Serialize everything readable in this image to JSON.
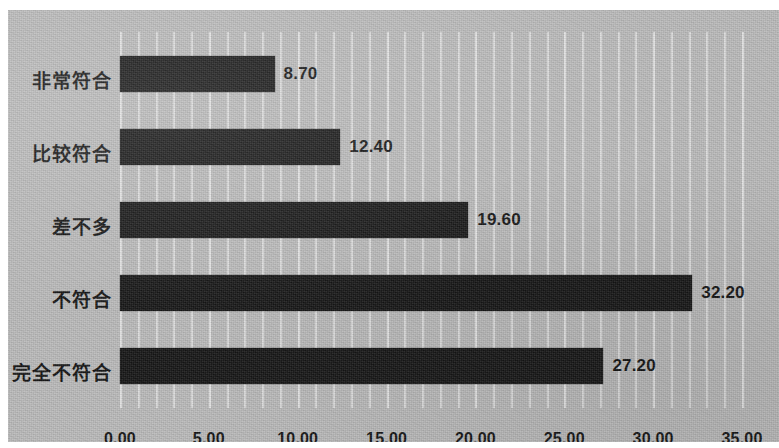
{
  "chart_data": {
    "type": "bar",
    "orientation": "horizontal",
    "title": "",
    "subtitle": "",
    "xlabel": "",
    "ylabel": "",
    "categories": [
      "非常符合",
      "比较符合",
      "差不多",
      "不符合",
      "完全不符合"
    ],
    "values": [
      8.7,
      12.4,
      19.6,
      32.2,
      27.2
    ],
    "value_labels": [
      "8.70",
      "12.40",
      "19.60",
      "32.20",
      "27.20"
    ],
    "xlim": [
      0,
      35
    ],
    "xticks": [
      0,
      5,
      10,
      15,
      20,
      25,
      30,
      35
    ],
    "xtick_labels": [
      "0.00",
      "5.00",
      "10.00",
      "15.00",
      "20.00",
      "25.00",
      "30.00",
      "35.00"
    ],
    "minor_gridline_step": 1,
    "grid": true,
    "grid_axis": "x",
    "legend": null,
    "legend_position": "none",
    "series": [
      {
        "name": "",
        "values": [
          8.7,
          12.4,
          19.6,
          32.2,
          27.2
        ]
      }
    ]
  },
  "style": {
    "plot_background": "#b9b9b9",
    "page_background": "#ffffff",
    "bar_color": "#141414",
    "gridline_color": "#dadada",
    "text_color": "#101010"
  }
}
